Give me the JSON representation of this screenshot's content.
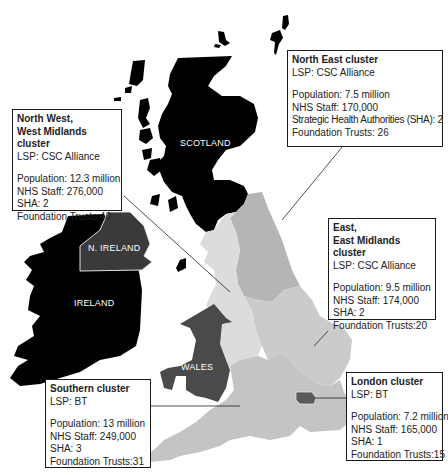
{
  "map": {
    "regions": [
      {
        "id": "scotland",
        "label": "SCOTLAND",
        "color": "#000000"
      },
      {
        "id": "n-ireland",
        "label": "N. IRELAND",
        "color": "#3a3a3a"
      },
      {
        "id": "ireland",
        "label": "IRELAND",
        "color": "#000000"
      },
      {
        "id": "wales",
        "label": "WALES",
        "color": "#4a4a4a"
      },
      {
        "id": "north-east",
        "label": "",
        "color": "#b5b5b5"
      },
      {
        "id": "north-west-west-midlands",
        "label": "",
        "color": "#dcdcdc"
      },
      {
        "id": "east-east-midlands",
        "label": "",
        "color": "#cbcbcb"
      },
      {
        "id": "southern",
        "label": "",
        "color": "#c4c4c4"
      },
      {
        "id": "london",
        "label": "",
        "color": "#5a5a5a"
      }
    ]
  },
  "clusters": [
    {
      "id": "north-east",
      "title_lines": [
        "North East cluster"
      ],
      "lsp": "LSP: CSC Alliance",
      "population": "Population: 7.5 million",
      "staff": "NHS Staff: 170,000",
      "sha": "Strategic Health Authorities (SHA): 2",
      "trusts": "Foundation Trusts: 26"
    },
    {
      "id": "north-west-west-midlands",
      "title_lines": [
        "North West,",
        "West Midlands cluster"
      ],
      "lsp": "LSP: CSC Alliance",
      "population": "Population: 12.3 million",
      "staff": "NHS Staff: 276,000",
      "sha": "SHA: 2",
      "trusts": "Foundation Trusts:40"
    },
    {
      "id": "east-east-midlands",
      "title_lines": [
        "East,",
        "East Midlands cluster"
      ],
      "lsp": "LSP: CSC Alliance",
      "population": "Population: 9.5 million",
      "staff": "NHS Staff: 174,000",
      "sha": "SHA: 2",
      "trusts": "Foundation Trusts:20"
    },
    {
      "id": "southern",
      "title_lines": [
        "Southern cluster"
      ],
      "lsp": "LSP: BT",
      "population": "Population: 13 million",
      "staff": "NHS Staff: 249,000",
      "sha": "SHA: 3",
      "trusts": "Foundation Trusts:31"
    },
    {
      "id": "london",
      "title_lines": [
        "London cluster"
      ],
      "lsp": "LSP: BT",
      "population": "Population: 7.2 million",
      "staff": "NHS Staff: 165,000",
      "sha": "SHA: 1",
      "trusts": "Foundation Trusts:15"
    }
  ]
}
